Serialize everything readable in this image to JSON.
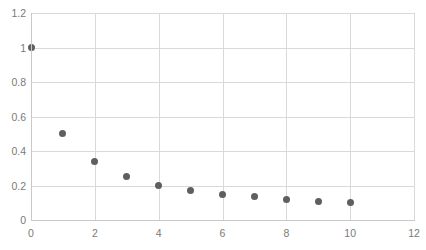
{
  "chart_data": {
    "type": "scatter",
    "title": "",
    "subtitle": "",
    "xlabel": "",
    "ylabel": "",
    "xlim": [
      0,
      12
    ],
    "ylim": [
      0,
      1.2
    ],
    "grid": true,
    "legend": null,
    "legend_position": "none",
    "marker_color": "#5F5F5F",
    "gridline_color": "#D9D9D9",
    "axis_color": "#C9C9C9",
    "tick_label_color": "#7A7A7A",
    "background_color": "#FFFFFF",
    "x_ticks": [
      0,
      2,
      4,
      6,
      8,
      10,
      12
    ],
    "x_tick_labels": [
      "0",
      "2",
      "4",
      "6",
      "8",
      "10",
      "12"
    ],
    "y_ticks": [
      0,
      0.2,
      0.4,
      0.6,
      0.8,
      1,
      1.2
    ],
    "y_tick_labels": [
      "0",
      "0.2",
      "0.4",
      "0.6",
      "0.8",
      "1",
      "1.2"
    ],
    "series": [
      {
        "name": "",
        "x": [
          0,
          1,
          2,
          3,
          4,
          5,
          6,
          7,
          8,
          9,
          10
        ],
        "y": [
          1.0,
          0.5,
          0.34,
          0.25,
          0.2,
          0.17,
          0.145,
          0.135,
          0.12,
          0.11,
          0.1
        ]
      }
    ]
  }
}
